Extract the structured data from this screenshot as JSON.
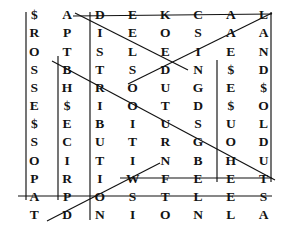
{
  "puzzle": {
    "type": "word-search-grid",
    "columns": 8,
    "rows": 12,
    "ink_color": "#131313",
    "line_color": "#111111",
    "background": "#ffffff",
    "grid": [
      [
        "$",
        "A",
        "D",
        "E",
        "K",
        "C",
        "A",
        "L"
      ],
      [
        "R",
        "P",
        "I",
        "E",
        "O",
        "S",
        "A",
        "A"
      ],
      [
        "O",
        "T",
        "S",
        "L",
        "E",
        "I",
        "E",
        "N"
      ],
      [
        "S",
        "B",
        "T",
        "S",
        "D",
        "N",
        "$",
        "D"
      ],
      [
        "S",
        "H",
        "R",
        "O",
        "U",
        "G",
        "E",
        "$"
      ],
      [
        "E",
        "$",
        "I",
        "O",
        "T",
        "D",
        "$",
        "O"
      ],
      [
        "$",
        "E",
        "B",
        "I",
        "U",
        "S",
        "U",
        "L"
      ],
      [
        "S",
        "C",
        "U",
        "T",
        "R",
        "G",
        "O",
        "D"
      ],
      [
        "O",
        "I",
        "T",
        "I",
        "N",
        "B",
        "H",
        "U"
      ],
      [
        "P",
        "R",
        "I",
        "W",
        "F",
        "E",
        "E",
        "T"
      ],
      [
        "A",
        "P",
        "O",
        "S",
        "T",
        "L",
        "E",
        "S"
      ],
      [
        "T",
        "D",
        "N",
        "I",
        "O",
        "N",
        "L",
        "A"
      ]
    ],
    "columns_read_down": [
      "$ROSSESSOPAT",
      "APTBH$ECIRPD",
      "DISTRIBUTION",
      "EELSOOITIWSI",
      "KOEDUTURNFTO",
      "CSINGDSGBELN",
      "AAE$E$UOHEEL",
      "LAND$OLDUTSA"
    ],
    "marked_words": [
      {
        "id": "row1-horizontal",
        "text": "DECKAL",
        "orientation": "horizontal"
      },
      {
        "id": "row10-horizontal",
        "text": "WFEET",
        "orientation": "horizontal"
      },
      {
        "id": "row11-horizontal",
        "text": "APOSTLES",
        "orientation": "horizontal"
      },
      {
        "id": "col3-vertical",
        "text": "DISTRIBUTION",
        "orientation": "vertical"
      },
      {
        "id": "col7-vertical",
        "text": "E$E$UOH",
        "orientation": "vertical"
      },
      {
        "id": "col8-vertical",
        "text": "LAND$OLDUT",
        "orientation": "vertical"
      },
      {
        "id": "col1-vertical",
        "text": "$ROSSESSOPA",
        "orientation": "vertical"
      },
      {
        "id": "col2-vertical",
        "text": "BH$ECIRP",
        "orientation": "vertical"
      },
      {
        "id": "diag-a",
        "text": "DEEN",
        "orientation": "diagonal-down-right"
      },
      {
        "id": "diag-b",
        "text": "LAIED",
        "orientation": "diagonal-down-left"
      },
      {
        "id": "diag-c",
        "text": "BROUGHT",
        "orientation": "diagonal-down-right"
      },
      {
        "id": "diag-d",
        "text": "DONW",
        "orientation": "diagonal-up-right"
      }
    ],
    "lines": [
      {
        "name": "line-row1-horizontal",
        "x1": 73,
        "y1": 16,
        "x2": 272,
        "y2": 14
      },
      {
        "name": "line-row10-horizontal",
        "x1": 120,
        "y1": 178,
        "x2": 272,
        "y2": 178
      },
      {
        "name": "line-row11-horizontal",
        "x1": 18,
        "y1": 196,
        "x2": 272,
        "y2": 196
      },
      {
        "name": "line-col1-vertical",
        "x1": 26,
        "y1": 12,
        "x2": 26,
        "y2": 200
      },
      {
        "name": "line-col2-vertical",
        "x1": 58,
        "y1": 56,
        "x2": 58,
        "y2": 200
      },
      {
        "name": "line-col3-vertical",
        "x1": 90,
        "y1": 12,
        "x2": 90,
        "y2": 220
      },
      {
        "name": "line-col7-vertical",
        "x1": 217,
        "y1": 60,
        "x2": 217,
        "y2": 182
      },
      {
        "name": "line-col8-vertical",
        "x1": 271,
        "y1": 12,
        "x2": 271,
        "y2": 182
      },
      {
        "name": "line-diag-a",
        "x1": 75,
        "y1": 13,
        "x2": 188,
        "y2": 70
      },
      {
        "name": "line-diag-b",
        "x1": 272,
        "y1": 13,
        "x2": 128,
        "y2": 84
      },
      {
        "name": "line-diag-c",
        "x1": 52,
        "y1": 61,
        "x2": 275,
        "y2": 180
      },
      {
        "name": "line-diag-d",
        "x1": 47,
        "y1": 221,
        "x2": 160,
        "y2": 163
      }
    ]
  }
}
